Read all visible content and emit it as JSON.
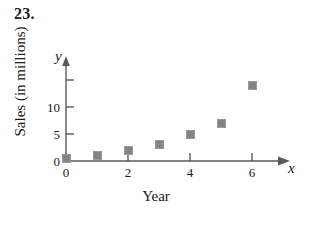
{
  "problem": {
    "number": "23."
  },
  "chart_data": {
    "type": "scatter",
    "title": "",
    "xlabel": "Year",
    "ylabel": "Sales (in millions)",
    "x_var_symbol": "x",
    "y_var_symbol": "y",
    "x": [
      0,
      1,
      2,
      3,
      4,
      5,
      6
    ],
    "values": [
      0.5,
      1,
      2,
      3,
      5,
      7,
      14
    ],
    "points": [
      {
        "x": 0,
        "y": 0.5
      },
      {
        "x": 1,
        "y": 1
      },
      {
        "x": 2,
        "y": 2
      },
      {
        "x": 3,
        "y": 3
      },
      {
        "x": 4,
        "y": 5
      },
      {
        "x": 5,
        "y": 7
      },
      {
        "x": 6,
        "y": 14
      }
    ],
    "xlim": [
      0,
      6.9
    ],
    "ylim": [
      0,
      16.5
    ],
    "x_ticks": [
      0,
      2,
      4,
      6
    ],
    "x_tick_labels": [
      "0",
      "2",
      "4",
      "6"
    ],
    "y_ticks": [
      5,
      10,
      15
    ],
    "y_tick_labels": [
      "5",
      "10",
      ""
    ],
    "y_origin_label": "0",
    "grid": false,
    "legend": null,
    "marker": "square",
    "marker_color": "#848484",
    "axis_color": "#595959"
  }
}
